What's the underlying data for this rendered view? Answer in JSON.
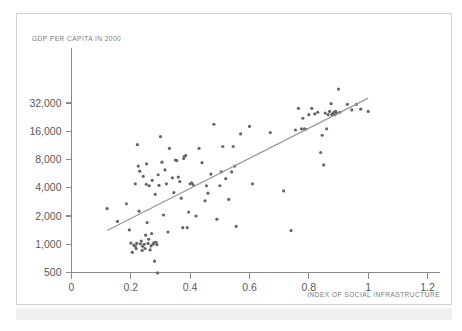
{
  "figure": {
    "background_color": "#ffffff",
    "frame_color": "#d2d2d2",
    "band_color": "#f0f0f0"
  },
  "chart_data": {
    "type": "scatter",
    "title": "",
    "ylabel": "GDP PER CAPITA IN 2000",
    "xlabel": "INDEX OF SOCIAL INFRASTRUCTURE",
    "xlim": [
      0,
      1.2
    ],
    "ylim": [
      430,
      60000
    ],
    "yscale": "log",
    "xscale": "linear",
    "grid": false,
    "legend": null,
    "point_color": "#666666",
    "line_color": "#9a9a9a",
    "xticks": [
      0,
      0.2,
      0.4,
      0.6,
      0.8,
      1,
      1.2
    ],
    "xtick_labels": [
      "0",
      "0.2",
      "0.4",
      "0.6",
      "0.8",
      "1",
      "1.2"
    ],
    "yticks": [
      500,
      1000,
      2000,
      4000,
      8000,
      16000,
      32000
    ],
    "ytick_labels": [
      "500",
      "1,000",
      "2,000",
      "4,000",
      "8,000",
      "16,000",
      "32,000"
    ],
    "trend_line": {
      "name": "fitted regression line",
      "x": [
        0.12,
        1.0
      ],
      "y": [
        1400,
        36000
      ]
    },
    "series": [
      {
        "name": "countries",
        "points": [
          [
            0.12,
            2400
          ],
          [
            0.155,
            1750
          ],
          [
            0.185,
            2700
          ],
          [
            0.195,
            1420
          ],
          [
            0.2,
            1030
          ],
          [
            0.205,
            820
          ],
          [
            0.21,
            980
          ],
          [
            0.215,
            4400
          ],
          [
            0.215,
            950
          ],
          [
            0.218,
            900
          ],
          [
            0.22,
            1020
          ],
          [
            0.222,
            11500
          ],
          [
            0.225,
            6800
          ],
          [
            0.228,
            2250
          ],
          [
            0.23,
            6000
          ],
          [
            0.232,
            1010
          ],
          [
            0.235,
            1080
          ],
          [
            0.238,
            860
          ],
          [
            0.24,
            950
          ],
          [
            0.242,
            5300
          ],
          [
            0.245,
            1000
          ],
          [
            0.248,
            900
          ],
          [
            0.25,
            1250
          ],
          [
            0.252,
            4350
          ],
          [
            0.253,
            7200
          ],
          [
            0.255,
            1700
          ],
          [
            0.258,
            1020
          ],
          [
            0.26,
            1130
          ],
          [
            0.262,
            4200
          ],
          [
            0.265,
            870
          ],
          [
            0.268,
            960
          ],
          [
            0.27,
            1300
          ],
          [
            0.272,
            4800
          ],
          [
            0.275,
            1000
          ],
          [
            0.278,
            1040
          ],
          [
            0.28,
            660
          ],
          [
            0.282,
            3400
          ],
          [
            0.285,
            1050
          ],
          [
            0.288,
            990
          ],
          [
            0.29,
            495
          ],
          [
            0.292,
            5500
          ],
          [
            0.295,
            4250
          ],
          [
            0.3,
            14000
          ],
          [
            0.305,
            7500
          ],
          [
            0.31,
            2050
          ],
          [
            0.315,
            6200
          ],
          [
            0.32,
            4400
          ],
          [
            0.325,
            1350
          ],
          [
            0.33,
            10500
          ],
          [
            0.34,
            5100
          ],
          [
            0.345,
            3550
          ],
          [
            0.35,
            7900
          ],
          [
            0.355,
            7800
          ],
          [
            0.36,
            5200
          ],
          [
            0.365,
            4650
          ],
          [
            0.37,
            3100
          ],
          [
            0.375,
            1500
          ],
          [
            0.378,
            8200
          ],
          [
            0.38,
            8600
          ],
          [
            0.385,
            8800
          ],
          [
            0.39,
            1500
          ],
          [
            0.395,
            2200
          ],
          [
            0.4,
            4400
          ],
          [
            0.405,
            4500
          ],
          [
            0.41,
            4300
          ],
          [
            0.42,
            2000
          ],
          [
            0.43,
            10500
          ],
          [
            0.44,
            7400
          ],
          [
            0.45,
            2900
          ],
          [
            0.455,
            4200
          ],
          [
            0.46,
            3500
          ],
          [
            0.47,
            5600
          ],
          [
            0.48,
            19000
          ],
          [
            0.49,
            1850
          ],
          [
            0.5,
            4200
          ],
          [
            0.505,
            5900
          ],
          [
            0.51,
            11000
          ],
          [
            0.52,
            5000
          ],
          [
            0.53,
            3000
          ],
          [
            0.54,
            5900
          ],
          [
            0.545,
            11000
          ],
          [
            0.55,
            6800
          ],
          [
            0.555,
            1550
          ],
          [
            0.57,
            15000
          ],
          [
            0.6,
            18000
          ],
          [
            0.61,
            4400
          ],
          [
            0.67,
            15500
          ],
          [
            0.715,
            3700
          ],
          [
            0.74,
            1400
          ],
          [
            0.755,
            16500
          ],
          [
            0.765,
            28000
          ],
          [
            0.775,
            17000
          ],
          [
            0.78,
            22000
          ],
          [
            0.785,
            17000
          ],
          [
            0.79,
            16800
          ],
          [
            0.8,
            24000
          ],
          [
            0.81,
            28000
          ],
          [
            0.82,
            24500
          ],
          [
            0.83,
            25500
          ],
          [
            0.84,
            9500
          ],
          [
            0.845,
            14500
          ],
          [
            0.85,
            7000
          ],
          [
            0.855,
            25000
          ],
          [
            0.86,
            17000
          ],
          [
            0.865,
            24000
          ],
          [
            0.87,
            26000
          ],
          [
            0.875,
            31500
          ],
          [
            0.878,
            24000
          ],
          [
            0.88,
            24500
          ],
          [
            0.885,
            25500
          ],
          [
            0.888,
            24000
          ],
          [
            0.89,
            26000
          ],
          [
            0.895,
            25000
          ],
          [
            0.9,
            45000
          ],
          [
            0.905,
            25500
          ],
          [
            0.93,
            31000
          ],
          [
            0.945,
            27000
          ],
          [
            0.96,
            31000
          ],
          [
            0.975,
            27500
          ],
          [
            1.0,
            26000
          ]
        ]
      }
    ]
  }
}
